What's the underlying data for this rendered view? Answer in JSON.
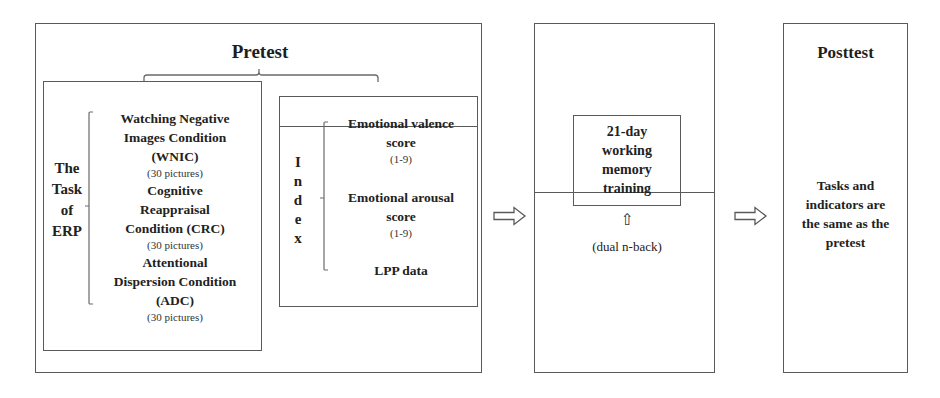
{
  "pretest": {
    "title": "Pretest",
    "task": {
      "label_lines": [
        "The",
        "Task",
        "of",
        "ERP"
      ],
      "conditions": [
        {
          "title_lines": [
            "Watching Negative",
            "Images Condition",
            "(WNIC)"
          ],
          "count": "(30 pictures)"
        },
        {
          "title_lines": [
            "Cognitive",
            "Reappraisal",
            "Condition (CRC)"
          ],
          "count": "(30 pictures)"
        },
        {
          "title_lines": [
            "Attentional",
            "Dispersion Condition",
            "(ADC)"
          ],
          "count": "(30 pictures)"
        }
      ]
    },
    "index": {
      "label_letters": [
        "I",
        "n",
        "d",
        "e",
        "x"
      ],
      "items": [
        {
          "title_lines": [
            "Emotional valence",
            "score"
          ],
          "range": "(1-9)"
        },
        {
          "title_lines": [
            "Emotional arousal",
            "score"
          ],
          "range": "(1-9)"
        },
        {
          "title_lines": [
            "LPP data"
          ],
          "range": ""
        }
      ]
    }
  },
  "training": {
    "title_lines": [
      "21-day",
      "working",
      "memory",
      "training"
    ],
    "up_arrow": "⇧",
    "method": "(dual n-back)"
  },
  "posttest": {
    "title": "Posttest",
    "description_lines": [
      "Tasks and",
      "indicators are",
      "the same as the",
      "pretest"
    ]
  },
  "arrows": [
    {
      "from": "pretest",
      "to": "training",
      "icon": "hollow-right-arrow"
    },
    {
      "from": "training",
      "to": "posttest",
      "icon": "hollow-right-arrow"
    }
  ],
  "colors": {
    "border": "#5a5a5a",
    "text": "#1a1a1a",
    "background": "#ffffff"
  }
}
